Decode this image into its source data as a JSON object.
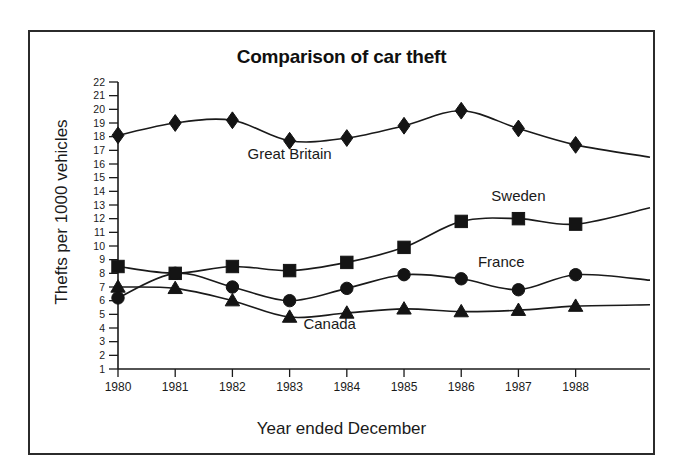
{
  "chart_data": {
    "type": "line",
    "title": "Comparison of car theft",
    "xlabel": "Year ended December",
    "ylabel": "Thefts per 1000 vehicles",
    "categories": [
      "1980",
      "1981",
      "1982",
      "1983",
      "1984",
      "1985",
      "1986",
      "1987",
      "1988"
    ],
    "x": [
      1980,
      1981,
      1982,
      1983,
      1984,
      1985,
      1986,
      1987,
      1988
    ],
    "xlim": [
      1980,
      1989.3
    ],
    "ylim": [
      1,
      22
    ],
    "ytick_labels": [
      "22",
      "21",
      "20",
      "19",
      "18",
      "17",
      "16",
      "15",
      "14",
      "13",
      "12",
      "11",
      "10",
      "9",
      "8",
      "7",
      "6",
      "5",
      "4",
      "3",
      "2",
      "1"
    ],
    "ytick_values": [
      22,
      21,
      20,
      19,
      18,
      17,
      16,
      15,
      14,
      13,
      12,
      11,
      10,
      9,
      8,
      7,
      6,
      5,
      4,
      3,
      2,
      1
    ],
    "grid": false,
    "legend_position": "inline-labels",
    "series": [
      {
        "name": "Great Britain",
        "marker": "diamond",
        "values": [
          18.1,
          19.0,
          19.2,
          17.7,
          17.9,
          18.8,
          19.9,
          18.6,
          17.4
        ],
        "tail_value": 16.5,
        "label_x": 1983.0,
        "label_y": 16.4
      },
      {
        "name": "Sweden",
        "marker": "square",
        "values": [
          8.5,
          8.0,
          8.5,
          8.2,
          8.8,
          9.9,
          11.8,
          12.0,
          11.6
        ],
        "tail_value": 12.8,
        "label_x": 1987.0,
        "label_y": 13.3
      },
      {
        "name": "France",
        "marker": "circle",
        "values": [
          6.2,
          8.0,
          7.0,
          6.0,
          6.9,
          7.9,
          7.6,
          6.8,
          7.9
        ],
        "tail_value": 7.5,
        "label_x": 1986.7,
        "label_y": 8.45
      },
      {
        "name": "Canada",
        "marker": "triangle",
        "values": [
          7.0,
          6.9,
          6.0,
          4.8,
          5.1,
          5.4,
          5.2,
          5.3,
          5.6
        ],
        "tail_value": 5.7,
        "label_x": 1983.7,
        "label_y": 3.9
      }
    ],
    "colors": {
      "line": "#1a1a1a",
      "marker": "#141414",
      "axis": "#1a1a1a",
      "border": "#2b2b2b",
      "background": "#ffffff"
    }
  }
}
